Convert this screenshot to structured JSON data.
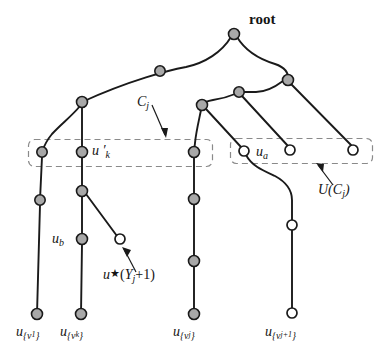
{
  "figure": {
    "width": 388,
    "height": 351,
    "background": "#ffffff",
    "colors": {
      "edge": "#1a1a1a",
      "filled_node_fill": "#a8a8a8",
      "filled_node_stroke": "#1a1a1a",
      "open_node_fill": "#ffffff",
      "open_node_stroke": "#1a1a1a",
      "dashed_box_stroke": "#7a7a7a",
      "text": "#141414"
    }
  },
  "labels": {
    "root": "root",
    "c_j": "C",
    "c_j_sub": "j",
    "u_prime_k": "u ′",
    "u_prime_k_sub": "k",
    "u_a": "u",
    "u_a_sub": "a",
    "u_b": "u",
    "u_b_sub": "b",
    "u_star": "u",
    "u_star_glyph": "★",
    "u_star_arg_open": "(Y",
    "u_star_arg_sub": "j",
    "u_star_arg_close": "+1)",
    "u_of_c_j": "U(C",
    "u_of_c_j_sub": "j",
    "u_of_c_j_close": ")",
    "leaf_1": "u",
    "leaf_1_sub": "{v",
    "leaf_1_sub2": "1",
    "leaf_1_sub_close": "}",
    "leaf_k": "u",
    "leaf_k_sub": "{v",
    "leaf_k_sub2": "k",
    "leaf_k_sub_close": "}",
    "leaf_j": "u",
    "leaf_j_sub": "{v",
    "leaf_j_sub2": "j",
    "leaf_j_sub_close": "}",
    "leaf_jp1": "u",
    "leaf_jp1_sub": "{v",
    "leaf_jp1_sub2": "j+1",
    "leaf_jp1_sub_close": "}"
  },
  "nodes": {
    "filled": [
      {
        "name": "root",
        "x": 234,
        "y": 34,
        "r": 5.5
      },
      {
        "name": "mid-left-upper",
        "x": 160,
        "y": 71,
        "r": 5.2
      },
      {
        "name": "left-branch-top",
        "x": 82,
        "y": 102,
        "r": 5.5
      },
      {
        "name": "mid-branch",
        "x": 202,
        "y": 105,
        "r": 5.5
      },
      {
        "name": "right-branch",
        "x": 239,
        "y": 92,
        "r": 5.2
      },
      {
        "name": "right-upper-junction",
        "x": 288,
        "y": 80,
        "r": 5.5
      },
      {
        "name": "leftcol-in-box",
        "x": 42,
        "y": 152,
        "r": 5.2
      },
      {
        "name": "ukprime-in-box",
        "x": 82,
        "y": 152,
        "r": 5.5
      },
      {
        "name": "midcol-in-box",
        "x": 194,
        "y": 152,
        "r": 5.5
      },
      {
        "name": "leftcol-second",
        "x": 40,
        "y": 200,
        "r": 5.2
      },
      {
        "name": "kcol-second",
        "x": 82,
        "y": 191,
        "r": 5.5
      },
      {
        "name": "midcol-second",
        "x": 194,
        "y": 199,
        "r": 5.5
      },
      {
        "name": "ub-node",
        "x": 82,
        "y": 239,
        "r": 5.5
      },
      {
        "name": "midcol-third",
        "x": 194,
        "y": 261,
        "r": 5.5
      },
      {
        "name": "leaf-v1",
        "x": 37,
        "y": 314,
        "r": 5.5
      },
      {
        "name": "leaf-vk",
        "x": 81,
        "y": 314,
        "r": 5.5
      },
      {
        "name": "leaf-vj",
        "x": 194,
        "y": 314,
        "r": 5.5
      }
    ],
    "open": [
      {
        "name": "ua-node",
        "x": 244,
        "y": 151,
        "r": 5.0
      },
      {
        "name": "open-mid-box",
        "x": 290,
        "y": 150,
        "r": 5.0
      },
      {
        "name": "open-right-box",
        "x": 353,
        "y": 150,
        "r": 5.0
      },
      {
        "name": "ustar-node",
        "x": 120,
        "y": 239,
        "r": 5.0
      },
      {
        "name": "rightcol-mid",
        "x": 292,
        "y": 225,
        "r": 5.0
      },
      {
        "name": "leaf-vjp1",
        "x": 292,
        "y": 313,
        "r": 5.0
      }
    ]
  },
  "boxes": [
    {
      "name": "c-j-box",
      "x": 28,
      "y": 139,
      "w": 184,
      "h": 27
    },
    {
      "name": "u-of-c-j-box",
      "x": 230,
      "y": 138,
      "w": 142,
      "h": 25
    }
  ]
}
